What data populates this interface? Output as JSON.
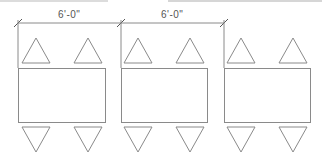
{
  "drawing": {
    "title": "Table layout plan with chairs",
    "stroke_color": "#8a8a8a",
    "dimensions": [
      {
        "label": "6'-0\"",
        "from_x": 18,
        "to_x": 121,
        "y": 23
      },
      {
        "label": "6'-0\"",
        "from_x": 121,
        "to_x": 224,
        "y": 23
      }
    ],
    "tables": [
      {
        "id": "table-1",
        "x": 18,
        "y": 68,
        "w": 87,
        "h": 54,
        "chairs_top_cx": [
          36,
          88
        ],
        "chairs_bottom_cx": [
          36,
          88
        ]
      },
      {
        "id": "table-2",
        "x": 121,
        "y": 68,
        "w": 86,
        "h": 54,
        "chairs_top_cx": [
          138,
          190
        ],
        "chairs_bottom_cx": [
          138,
          190
        ]
      },
      {
        "id": "table-3",
        "x": 224,
        "y": 68,
        "w": 86,
        "h": 54,
        "chairs_top_cx": [
          241,
          293
        ],
        "chairs_bottom_cx": [
          241,
          293
        ]
      }
    ],
    "chair": {
      "half_width": 14,
      "top_apex_y": 38,
      "top_base_y": 63,
      "bottom_base_y": 127,
      "bottom_apex_y": 152
    }
  }
}
